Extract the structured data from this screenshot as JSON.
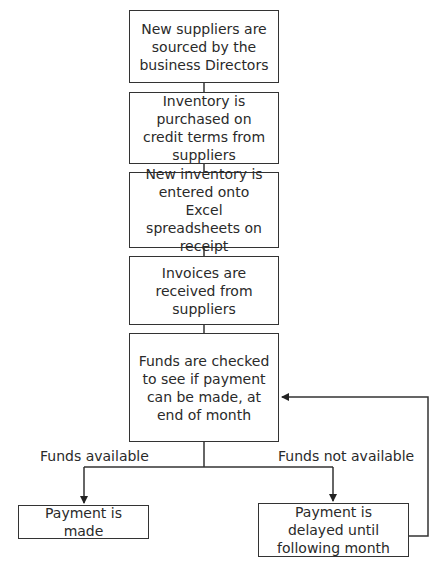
{
  "diagram": {
    "type": "flowchart",
    "steps": [
      {
        "id": "s1",
        "text": "New suppliers are sourced by the business Directors"
      },
      {
        "id": "s2",
        "text": "Inventory is purchased on credit terms from suppliers"
      },
      {
        "id": "s3",
        "text": "New inventory is entered onto Excel spreadsheets on receipt"
      },
      {
        "id": "s4",
        "text": "Invoices are received from suppliers"
      },
      {
        "id": "s5",
        "text": "Funds are checked to see if payment can be made, at end of month"
      }
    ],
    "branches": {
      "left_label": "Funds available",
      "right_label": "Funds not available"
    },
    "outcomes": [
      {
        "id": "o1",
        "text": "Payment is made"
      },
      {
        "id": "o2",
        "text": "Payment is delayed until following month"
      }
    ],
    "edges": [
      {
        "from": "s1",
        "to": "s2"
      },
      {
        "from": "s2",
        "to": "s3"
      },
      {
        "from": "s3",
        "to": "s4"
      },
      {
        "from": "s4",
        "to": "s5"
      },
      {
        "from": "s5",
        "to": "o1",
        "label": "Funds available"
      },
      {
        "from": "s5",
        "to": "o2",
        "label": "Funds not available"
      },
      {
        "from": "o2",
        "to": "s5",
        "type": "loop-back"
      }
    ],
    "colors": {
      "line": "#333333",
      "background": "#ffffff",
      "text": "#2a2a2a"
    }
  }
}
